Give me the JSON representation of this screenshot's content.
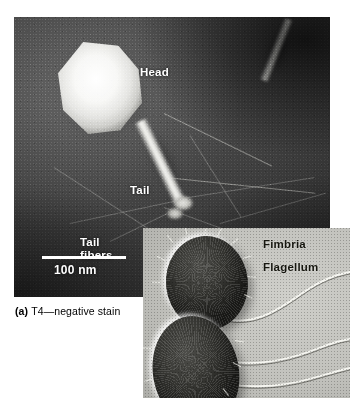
{
  "figure": {
    "caption_tag": "(a)",
    "caption_text": "T4—negative stain"
  },
  "em_panel": {
    "name": "t4-bacteriophage-negative-stain-micrograph",
    "labels": {
      "head": "Head",
      "tail": "Tail",
      "tail_fibers_line1": "Tail",
      "tail_fibers_line2": "fibers"
    },
    "scale_bar": {
      "label": "100 nm",
      "length_px": 84
    },
    "colors": {
      "background": "#3a3a3a",
      "label_text": "#ffffff",
      "scale_bar": "#ffffff"
    }
  },
  "inset_panel": {
    "name": "bacteria-shadow-cast-micrograph",
    "labels": {
      "fimbria": "Fimbria",
      "flagellum": "Flagellum"
    },
    "colors": {
      "background": "#c2c2bd",
      "cell": "#2a2a26",
      "label_text": "#16160f",
      "flagellum": "#f4f4ef"
    }
  }
}
